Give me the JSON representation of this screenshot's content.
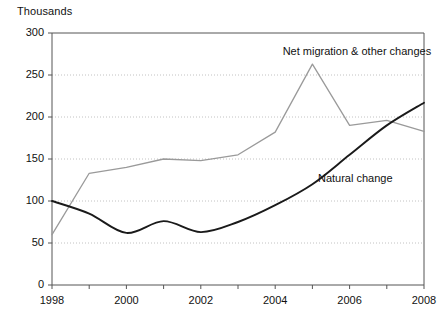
{
  "chart_data": {
    "type": "line",
    "title": "",
    "subtitle": "",
    "unit_label": "Thousands",
    "xlabel": "",
    "ylabel": "",
    "x": [
      1998,
      1999,
      2000,
      2001,
      2002,
      2003,
      2004,
      2005,
      2006,
      2007,
      2008
    ],
    "categories": [
      "1998",
      "1999",
      "2000",
      "2001",
      "2002",
      "2003",
      "2004",
      "2005",
      "2006",
      "2007",
      "2008"
    ],
    "xlim": [
      1998,
      2008
    ],
    "ylim": [
      0,
      300
    ],
    "y_ticks": [
      0,
      50,
      100,
      150,
      200,
      250,
      300
    ],
    "y_tick_labels": [
      "0",
      "50",
      "100",
      "150",
      "200",
      "250",
      "300"
    ],
    "x_ticks": [
      1998,
      1999,
      2000,
      2001,
      2002,
      2003,
      2004,
      2005,
      2006,
      2007,
      2008
    ],
    "x_tick_labels": [
      "1998",
      "",
      "2000",
      "",
      "2002",
      "",
      "2004",
      "",
      "2006",
      "",
      "2008"
    ],
    "grid": "horizontal-dotted",
    "legend": "inline-annotations",
    "series": [
      {
        "name": "Net migration & other changes",
        "color": "#9a9a9a",
        "values": [
          60,
          133,
          140,
          150,
          148,
          155,
          182,
          263,
          190,
          196,
          183
        ],
        "label_x": 2004.2,
        "label_y": 277
      },
      {
        "name": "Natural change",
        "color": "#1a1a1a",
        "values": [
          100,
          85,
          62,
          76,
          63,
          75,
          95,
          120,
          155,
          190,
          217
        ],
        "label_x": 2005.15,
        "label_y": 126
      }
    ]
  },
  "colors": {
    "background": "#ffffff",
    "axis": "#555555",
    "grid": "#bbbbbb",
    "text": "#111111",
    "series_grey": "#9a9a9a",
    "series_black": "#1a1a1a"
  }
}
